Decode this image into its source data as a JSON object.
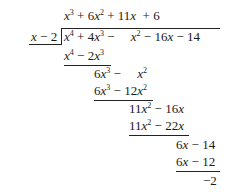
{
  "division": {
    "divisor": "x − 2",
    "dividend": "x^4 + 4x^3 − x^2 − 16x − 14",
    "quotient": "x^3 + 6x^2 + 11x + 6",
    "remainder": "−2",
    "quotient_terms": [
      {
        "var": "x",
        "exp": "3"
      },
      {
        "sign": " + ",
        "coef": "6",
        "var": "x",
        "exp": "2"
      },
      {
        "sign": " + ",
        "coef": "11",
        "var": "x"
      },
      {
        "sign": "  + ",
        "coef": "6"
      }
    ],
    "steps": [
      {
        "id": "sub1",
        "text": "x^4 − 2x^3"
      },
      {
        "id": "rem1",
        "text": "6x^3 − x^2"
      },
      {
        "id": "sub2",
        "text": "6x^3 − 12x^2"
      },
      {
        "id": "rem2",
        "text": "11x^2 − 16x"
      },
      {
        "id": "sub3",
        "text": "11x^2 − 22x"
      },
      {
        "id": "rem3",
        "text": "6x − 14"
      },
      {
        "id": "sub4",
        "text": "6x − 12"
      },
      {
        "id": "rem4",
        "text": "−2"
      }
    ],
    "glyphs": {
      "x": "x",
      "plus": "+",
      "minus": "−",
      "n2": "2",
      "n3": "3",
      "n4": "4",
      "n6": "6",
      "n11": "11",
      "n12": "12",
      "n14": "14",
      "n16": "16",
      "n22": "22"
    }
  }
}
